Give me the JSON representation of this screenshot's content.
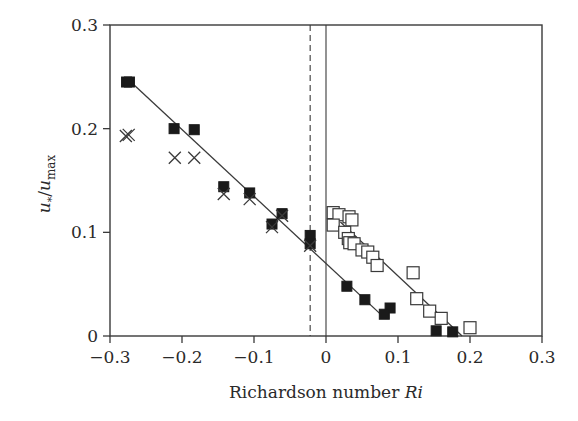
{
  "chart_data": {
    "type": "scatter",
    "title": "",
    "xlabel": "Richardson number Ri",
    "xlabel_plain": "Richardson number ",
    "xlabel_italic": "Ri",
    "ylabel": "u*/umax",
    "xlim": [
      -0.3,
      0.3
    ],
    "ylim": [
      0,
      0.3
    ],
    "xticks": [
      -0.3,
      -0.2,
      -0.1,
      0,
      0.1,
      0.2,
      0.3
    ],
    "xtick_labels": [
      "−0.3",
      "−0.2",
      "−0.1",
      "0",
      "0.1",
      "0.2",
      "0.3"
    ],
    "yticks": [
      0,
      0.1,
      0.2,
      0.3
    ],
    "ytick_labels": [
      "0",
      "0.1",
      "0.2",
      "0.3"
    ],
    "grid": false,
    "legend": null,
    "vertical_lines": [
      {
        "x": -0.022,
        "style": "dashed"
      },
      {
        "x": 0.0,
        "style": "solid"
      }
    ],
    "series": [
      {
        "name": "filled squares",
        "marker": "filled-square",
        "points": [
          [
            -0.277,
            0.245
          ],
          [
            -0.273,
            0.245
          ],
          [
            -0.211,
            0.2
          ],
          [
            -0.183,
            0.199
          ],
          [
            -0.142,
            0.144
          ],
          [
            -0.106,
            0.138
          ],
          [
            -0.075,
            0.108
          ],
          [
            -0.061,
            0.118
          ],
          [
            -0.022,
            0.097
          ],
          [
            -0.022,
            0.089
          ],
          [
            0.029,
            0.048
          ],
          [
            0.054,
            0.035
          ],
          [
            0.089,
            0.027
          ],
          [
            0.081,
            0.021
          ],
          [
            0.153,
            0.005
          ],
          [
            0.176,
            0.004
          ]
        ]
      },
      {
        "name": "crosses",
        "marker": "x",
        "points": [
          [
            -0.278,
            0.193
          ],
          [
            -0.274,
            0.194
          ],
          [
            -0.21,
            0.172
          ],
          [
            -0.183,
            0.172
          ],
          [
            -0.142,
            0.137
          ],
          [
            -0.106,
            0.132
          ],
          [
            -0.075,
            0.105
          ],
          [
            -0.061,
            0.116
          ],
          [
            -0.022,
            0.087
          ]
        ]
      },
      {
        "name": "open squares",
        "marker": "open-square",
        "points": [
          [
            0.01,
            0.119
          ],
          [
            0.018,
            0.117
          ],
          [
            0.032,
            0.115
          ],
          [
            0.036,
            0.112
          ],
          [
            0.01,
            0.107
          ],
          [
            0.026,
            0.1
          ],
          [
            0.031,
            0.094
          ],
          [
            0.033,
            0.09
          ],
          [
            0.039,
            0.089
          ],
          [
            0.05,
            0.083
          ],
          [
            0.058,
            0.081
          ],
          [
            0.065,
            0.076
          ],
          [
            0.071,
            0.068
          ],
          [
            0.121,
            0.061
          ],
          [
            0.126,
            0.036
          ],
          [
            0.144,
            0.024
          ],
          [
            0.16,
            0.017
          ],
          [
            0.2,
            0.008
          ]
        ]
      }
    ],
    "fit_lines": [
      {
        "name": "fit unstable",
        "from": [
          -0.274,
          0.247
        ],
        "to": [
          0.082,
          0.017
        ]
      },
      {
        "name": "fit stable",
        "from": [
          0.02,
          0.11
        ],
        "to": [
          0.189,
          0.0
        ]
      }
    ]
  }
}
